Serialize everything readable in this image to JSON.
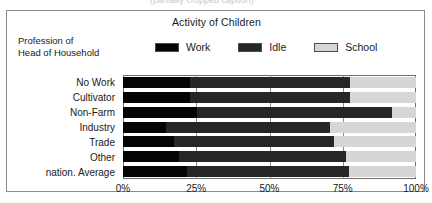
{
  "figure": {
    "title": "Activity of Children",
    "axis_caption_line1": "Profession of",
    "axis_caption_line2": "Head of Household",
    "top_cropped_text": "(partially cropped caption)"
  },
  "legend": {
    "items": [
      {
        "label": "Work",
        "color": "#040404"
      },
      {
        "label": "Idle",
        "color": "#262626"
      },
      {
        "label": "School",
        "color": "#d6d6d6"
      }
    ]
  },
  "axis": {
    "ticks": [
      "0%",
      "25%",
      "50%",
      "75%",
      "100%"
    ]
  },
  "chart_data": {
    "type": "bar",
    "orientation": "horizontal",
    "stacked": true,
    "percent": true,
    "title": "Activity of Children",
    "xlabel": "",
    "ylabel": "Profession of Head of Household",
    "xlim": [
      0,
      100
    ],
    "xticks": [
      0,
      25,
      50,
      75,
      100
    ],
    "xtick_labels": [
      "0%",
      "25%",
      "50%",
      "75%",
      "100%"
    ],
    "grid": true,
    "legend_position": "top",
    "categories": [
      "No Work",
      "Cultivator",
      "Non-Farm",
      "Industry",
      "Trade",
      "Other",
      "nation. Average"
    ],
    "series": [
      {
        "name": "Work",
        "color": "#040404",
        "values": [
          22.8,
          22.8,
          25.3,
          14.8,
          17.5,
          19.0,
          21.8
        ]
      },
      {
        "name": "Idle",
        "color": "#262626",
        "values": [
          54.6,
          54.6,
          66.5,
          55.7,
          54.4,
          57.2,
          55.2
        ]
      },
      {
        "name": "School",
        "color": "#d6d6d6",
        "values": [
          22.6,
          22.6,
          8.2,
          29.5,
          28.1,
          23.8,
          23.0
        ]
      }
    ],
    "cumulative_boundaries": {
      "work_end": [
        22.8,
        22.8,
        25.3,
        14.8,
        17.5,
        19.0,
        21.8
      ],
      "idle_end": [
        77.4,
        77.4,
        91.8,
        70.5,
        71.9,
        76.2,
        77.0
      ]
    }
  }
}
